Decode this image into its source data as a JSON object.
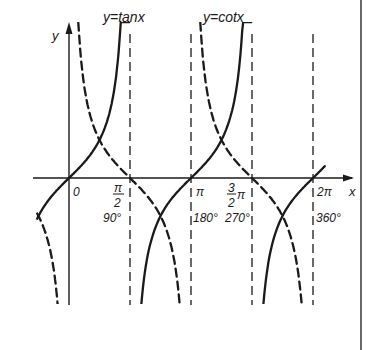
{
  "labels": {
    "tan_label": "y=tanx",
    "cot_label": "y=cotx",
    "y_axis": "y",
    "x_axis": "x",
    "origin": "0",
    "ticks": [
      {
        "rad_num": "π",
        "rad_den": "2",
        "deg": "90°"
      },
      {
        "rad": "π",
        "deg": "180°"
      },
      {
        "rad_num": "3",
        "rad_den": "2",
        "rad_sym": "π",
        "deg": "270°"
      },
      {
        "rad": "2π",
        "deg": "360°"
      }
    ]
  },
  "colors": {
    "ink": "#1a1a1a",
    "background": "#ffffff"
  },
  "chart_data": {
    "type": "line",
    "title": "",
    "xlabel": "x",
    "ylabel": "y",
    "x_ticks": [
      "0",
      "π/2 (90°)",
      "π (180°)",
      "3π/2 (270°)",
      "2π (360°)"
    ],
    "x_range": [
      -0.9,
      7.3
    ],
    "asymptotes_tan": [
      "π/2",
      "3π/2"
    ],
    "asymptotes_cot": [
      "0",
      "π",
      "2π"
    ],
    "series": [
      {
        "name": "y=tanx",
        "style": "solid",
        "function": "tan(x)",
        "points": [
          [
            -0.785,
            -1
          ],
          [
            0,
            0
          ],
          [
            0.785,
            1
          ],
          [
            2.356,
            -1
          ],
          [
            3.1416,
            0
          ],
          [
            3.927,
            1
          ],
          [
            5.498,
            -1
          ],
          [
            6.283,
            0
          ]
        ]
      },
      {
        "name": "y=cotx",
        "style": "dashed",
        "function": "cot(x)",
        "points": [
          [
            -0.785,
            -1
          ],
          [
            0.785,
            1
          ],
          [
            1.5708,
            0
          ],
          [
            2.356,
            -1
          ],
          [
            3.927,
            1
          ],
          [
            4.712,
            0
          ],
          [
            5.498,
            -1
          ]
        ]
      }
    ],
    "intersections": [
      [
        -0.785,
        -1
      ],
      [
        0.785,
        1
      ],
      [
        2.356,
        -1
      ],
      [
        3.927,
        1
      ],
      [
        5.498,
        -1
      ]
    ],
    "grid": false,
    "legend": "inline labels above curves"
  }
}
